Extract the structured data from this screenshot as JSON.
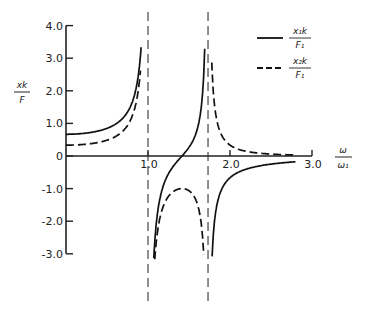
{
  "chart_data": {
    "type": "line",
    "title": "",
    "xlabel": "ω/ω₁",
    "ylabel": "xk/F",
    "xlim": [
      0,
      3.0
    ],
    "ylim": [
      -3.0,
      4.0
    ],
    "x_ticks": [
      1.0,
      2.0,
      3.0
    ],
    "x_tick_labels": [
      "1.0",
      "2.0",
      "3.0"
    ],
    "y_ticks": [
      4.0,
      3.0,
      2.0,
      1.0,
      0,
      -1.0,
      -2.0,
      -3.0
    ],
    "y_tick_labels": [
      "4.0",
      "3.0",
      "2.0",
      "1.0",
      "0",
      "-1.0",
      "-2.0",
      "-3.0"
    ],
    "grid": false,
    "legend_position": "upper right",
    "asymptotes_x": [
      1.0,
      1.732
    ],
    "series": [
      {
        "name": "x1k/F1",
        "style": "solid",
        "x": [
          0,
          0.2,
          0.4,
          0.6,
          0.8,
          0.9,
          0.95,
          1.05,
          1.1,
          1.2,
          1.3,
          1.38,
          1.5,
          1.6,
          1.68,
          1.72,
          1.75,
          1.8,
          1.9,
          2.0,
          2.2,
          2.5,
          2.8
        ],
        "values": [
          0.67,
          0.68,
          0.71,
          0.79,
          1.04,
          1.53,
          2.55,
          -3.2,
          -1.75,
          -0.82,
          -0.27,
          0.0,
          0.44,
          1.05,
          2.1,
          3.3,
          -3.2,
          -1.6,
          -0.65,
          -0.33,
          -0.16,
          -0.07,
          -0.04
        ]
      },
      {
        "name": "x2k/F1",
        "style": "dashed",
        "x": [
          0,
          0.2,
          0.4,
          0.6,
          0.8,
          0.9,
          0.95,
          1.05,
          1.1,
          1.2,
          1.3,
          1.4,
          1.5,
          1.6,
          1.68,
          1.72,
          1.75,
          1.8,
          1.9,
          2.0,
          2.2,
          2.5,
          2.8
        ],
        "values": [
          0.33,
          0.35,
          0.38,
          0.46,
          0.72,
          1.21,
          2.2,
          -2.5,
          -1.42,
          -1.12,
          -1.01,
          -1.0,
          -1.07,
          -1.3,
          -1.9,
          -2.8,
          3.0,
          1.55,
          0.56,
          0.33,
          0.13,
          0.07,
          0.02
        ]
      }
    ],
    "legend": [
      {
        "label_num": "x₁k",
        "label_den": "F₁",
        "style": "solid"
      },
      {
        "label_num": "x₂k",
        "label_den": "F₁",
        "style": "dashed"
      }
    ]
  },
  "labels": {
    "y_num": "xk",
    "y_den": "F",
    "x_num": "ω",
    "x_den": "ω₁"
  }
}
